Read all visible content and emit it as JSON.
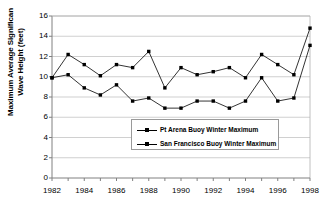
{
  "chart_data": {
    "type": "line",
    "title": "",
    "xlabel": "",
    "ylabel": "Maximum Average Significan Wave Height (feet)",
    "ylabel_line1": "Maximum Average Significan",
    "ylabel_line2": "Wave Height (feet)",
    "x": [
      1982,
      1983,
      1984,
      1985,
      1986,
      1987,
      1988,
      1989,
      1990,
      1991,
      1992,
      1993,
      1994,
      1995,
      1996,
      1997,
      1998
    ],
    "xlim": [
      1982,
      1998
    ],
    "ylim": [
      0,
      16
    ],
    "yticks": [
      0,
      2,
      4,
      6,
      8,
      10,
      12,
      14,
      16
    ],
    "ytick_labels": [
      "0",
      "2",
      "4",
      "6",
      "8",
      "10",
      "12",
      "14",
      "16"
    ],
    "xticks": [
      1982,
      1983,
      1984,
      1985,
      1986,
      1987,
      1988,
      1989,
      1990,
      1991,
      1992,
      1993,
      1994,
      1995,
      1996,
      1997,
      1998
    ],
    "xtick_labels_shown": [
      "1982",
      "1984",
      "1986",
      "1988",
      "1990",
      "1992",
      "1994",
      "1996",
      "1998"
    ],
    "xtick_labeled_values": [
      1982,
      1984,
      1986,
      1988,
      1990,
      1992,
      1994,
      1996,
      1998
    ],
    "grid": "horizontal",
    "legend_position": "center",
    "marker": "square",
    "line_color": "#000000",
    "marker_color": "#000000",
    "grid_color": "#b0b0b0",
    "axis_color": "#808080",
    "background": "#ffffff",
    "series": [
      {
        "name": "Pt Arena Buoy Winter Maximum",
        "values": [
          9.9,
          12.2,
          11.2,
          10.1,
          11.2,
          10.9,
          12.5,
          8.9,
          10.9,
          10.2,
          10.5,
          10.9,
          9.9,
          12.2,
          11.2,
          10.2,
          14.8
        ]
      },
      {
        "name": "San Francisco Buoy Winter Maximum",
        "values": [
          9.9,
          10.2,
          8.9,
          8.2,
          9.2,
          7.6,
          7.9,
          6.9,
          6.9,
          7.6,
          7.6,
          6.9,
          7.6,
          9.9,
          7.6,
          7.9,
          13.1
        ]
      }
    ]
  },
  "legend": {
    "entries": [
      {
        "label": "Pt Arena Buoy Winter Maximum"
      },
      {
        "label": "San Francisco Buoy Winter Maximum"
      }
    ]
  }
}
